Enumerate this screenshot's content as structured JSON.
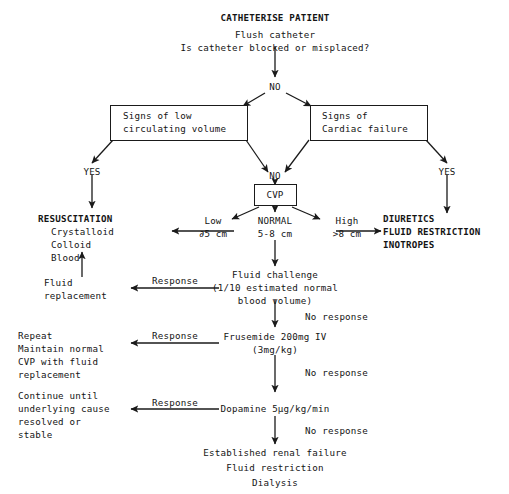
{
  "nodes": {
    "header_title": "CATHETERISE PATIENT",
    "header_line2": "Flush catheter",
    "header_line3": "Is catheter blocked or misplaced?",
    "no_top": "NO",
    "box_low_volume_l1": "Signs of low",
    "box_low_volume_l2": "circulating volume",
    "box_cardiac_l1": "Signs of",
    "box_cardiac_l2": "Cardiac failure",
    "yes_left": "YES",
    "yes_right": "YES",
    "no_middle": "NO",
    "cvp_box": "CVP",
    "cvp_low_label": "Low",
    "cvp_low_value": "∂5 cm",
    "cvp_normal_label": "NORMAL",
    "cvp_normal_value": "5-8 cm",
    "cvp_high_label": "High",
    "cvp_high_value": ">8 cm",
    "resuscitation_l1": "RESUSCITATION",
    "resuscitation_l2": "Crystalloid",
    "resuscitation_l3": "Colloid",
    "resuscitation_l4": "Blood",
    "diuretics_l1": "DIURETICS",
    "diuretics_l2": "FLUID RESTRICTION",
    "diuretics_l3": "INOTROPES",
    "fluid_replacement_l1": "Fluid",
    "fluid_replacement_l2": "replacement",
    "fluid_challenge_l1": "Fluid challenge",
    "fluid_challenge_l2": "(1/10 estimated normal",
    "fluid_challenge_l3": "blood volume)",
    "repeat_l1": "Repeat",
    "repeat_l2": "Maintain normal",
    "repeat_l3": "CVP with fluid",
    "repeat_l4": "replacement",
    "frusemide_l1": "Frusemide 200mg IV",
    "frusemide_l2": "(3mg/kg)",
    "continue_l1": "Continue until",
    "continue_l2": "underlying cause",
    "continue_l3": "resolved or",
    "continue_l4": "stable",
    "dopamine": "Dopamine 5µg/kg/min",
    "established_l1": "Established renal failure",
    "established_l2": "Fluid restriction",
    "established_l3": "Dialysis",
    "response_1": "Response",
    "response_2": "Response",
    "response_3": "Response",
    "no_response_1": "No response",
    "no_response_2": "No response",
    "no_response_3": "No response"
  },
  "colors": {
    "ink": "#141414",
    "line": "#1a1a1a",
    "background": "#ffffff"
  }
}
